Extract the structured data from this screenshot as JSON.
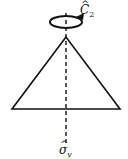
{
  "diagram": {
    "type": "symmetry-elements",
    "shape": "triangle",
    "labels": {
      "rotation_axis": {
        "symbol": "C",
        "hat": "^",
        "subscript": "2"
      },
      "mirror_plane": {
        "symbol": "σ",
        "hat": "^",
        "subscript": "v"
      }
    },
    "colors": {
      "stroke": "#111111",
      "background": "#ffffff"
    }
  }
}
